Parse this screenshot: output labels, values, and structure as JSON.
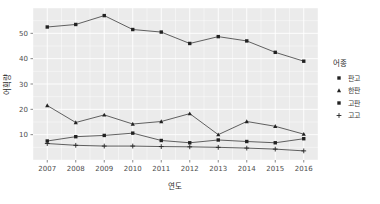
{
  "chart_data": {
    "type": "line",
    "title": "",
    "xlabel": "연도",
    "ylabel": "어획량",
    "categories": [
      "2007",
      "2008",
      "2009",
      "2010",
      "2011",
      "2012",
      "2013",
      "2014",
      "2015",
      "2016"
    ],
    "xlim": [
      2006.5,
      2016.5
    ],
    "ylim": [
      0,
      60
    ],
    "yticks": [
      10,
      20,
      30,
      40,
      50
    ],
    "ytick_labels": [
      "10",
      "20",
      "30",
      "40",
      "50"
    ],
    "grid": true,
    "legend_position": "right",
    "legend_title": "어종",
    "series": [
      {
        "name": "판고",
        "marker": "square",
        "values": [
          52.5,
          53.5,
          57.0,
          51.5,
          50.5,
          46.0,
          48.7,
          47.0,
          42.5,
          39.0
        ]
      },
      {
        "name": "한판",
        "marker": "triangle",
        "values": [
          21.5,
          14.8,
          17.8,
          14.2,
          15.2,
          18.3,
          10.0,
          15.2,
          13.3,
          10.2
        ]
      },
      {
        "name": "고판",
        "marker": "square",
        "values": [
          7.5,
          9.2,
          9.7,
          10.6,
          7.7,
          6.8,
          7.9,
          7.3,
          6.8,
          8.4
        ]
      },
      {
        "name": "고고",
        "marker": "plus",
        "values": [
          6.5,
          5.8,
          5.5,
          5.5,
          5.3,
          5.2,
          5.0,
          4.7,
          4.3,
          3.6
        ]
      }
    ]
  },
  "colors": {
    "panel": "#ebebeb",
    "grid": "#ffffff",
    "line": "#3b3b3b",
    "marker": "#222222",
    "text": "#3d3d3d"
  }
}
